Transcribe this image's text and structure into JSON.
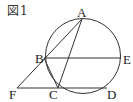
{
  "figure": {
    "caption": "図1",
    "labels": {
      "A": "A",
      "B": "B",
      "C": "C",
      "D": "D",
      "E": "E",
      "F": "F"
    },
    "colors": {
      "stroke": "#333333",
      "text": "#222222",
      "background": "#ffffff"
    }
  }
}
